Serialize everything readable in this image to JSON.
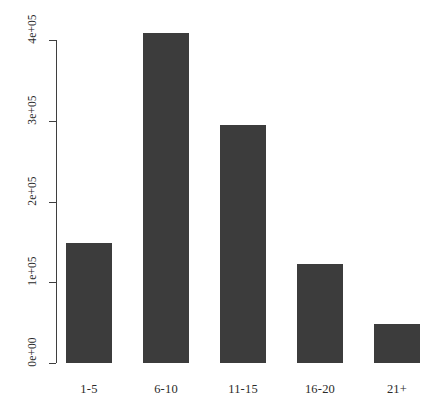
{
  "chart_data": {
    "type": "bar",
    "title": "",
    "subtitle": "",
    "xlabel": "",
    "ylabel": "",
    "categories": [
      "1-5",
      "6-10",
      "11-15",
      "16-20",
      "21+"
    ],
    "values": [
      148000,
      409000,
      295000,
      122000,
      48000
    ],
    "series": [
      {
        "name": "count",
        "values": [
          148000,
          409000,
          295000,
          122000,
          48000
        ]
      }
    ],
    "ytick_labels": [
      "0e+00",
      "1e+05",
      "2e+05",
      "3e+05",
      "4e+05"
    ],
    "ytick_values": [
      0,
      100000,
      200000,
      300000,
      400000
    ],
    "ylim": [
      0,
      400000
    ],
    "grid": false,
    "legend": false,
    "legend_position": "none",
    "bar_color": "#3c3c3c",
    "axis_color": "#3f3f3f",
    "background_color": "#ffffff"
  },
  "axes": {
    "y": {
      "ticks": [
        {
          "label": "0e+00",
          "value": 0
        },
        {
          "label": "1e+05",
          "value": 100000
        },
        {
          "label": "2e+05",
          "value": 200000
        },
        {
          "label": "3e+05",
          "value": 300000
        },
        {
          "label": "4e+05",
          "value": 400000
        }
      ]
    },
    "x": {
      "ticks": [
        {
          "label": "1-5"
        },
        {
          "label": "6-10"
        },
        {
          "label": "11-15"
        },
        {
          "label": "16-20"
        },
        {
          "label": "21+"
        }
      ]
    }
  }
}
